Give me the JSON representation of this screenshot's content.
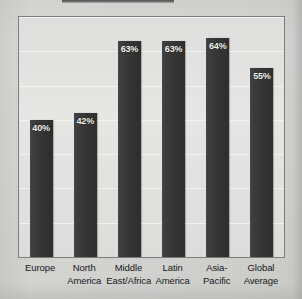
{
  "document": {
    "background_color": "#e8e8e6",
    "plot_background_color": "#e0e0de",
    "border_color": "#7c7c7c",
    "bar_color": "#343434",
    "value_label_color": "#f2f2f0",
    "gridline_color": "#f4f4f2"
  },
  "chart_data": {
    "type": "bar",
    "title": "",
    "subtitle": "",
    "xlabel": "",
    "ylabel": "",
    "ylim": [
      0,
      70
    ],
    "grid": true,
    "gridline_values": [
      10,
      20,
      30,
      40,
      50,
      60,
      70
    ],
    "legend": false,
    "legend_position": "none",
    "orientation": "vertical",
    "value_suffix": "%",
    "categories": [
      "Europe",
      "North America",
      "Middle East/Africa",
      "Latin America",
      "Asia-Pacific",
      "Global Average"
    ],
    "category_lines": [
      [
        "Europe",
        ""
      ],
      [
        "North",
        "America"
      ],
      [
        "Middle",
        "East/Africa"
      ],
      [
        "Latin",
        "America"
      ],
      [
        "Asia-",
        "Pacific"
      ],
      [
        "Global",
        "Average"
      ]
    ],
    "values": [
      40,
      42,
      63,
      63,
      64,
      55
    ],
    "data_labels": [
      "40%",
      "42%",
      "63%",
      "63%",
      "64%",
      "55%"
    ],
    "series": [
      {
        "name": "",
        "values": [
          40,
          42,
          63,
          63,
          64,
          55
        ]
      }
    ]
  }
}
